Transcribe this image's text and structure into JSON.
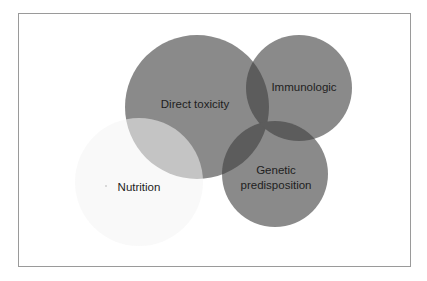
{
  "diagram": {
    "type": "venn",
    "sets": [
      {
        "id": "direct-toxicity",
        "label": "Direct toxicity",
        "label_lines": [
          "Direct toxicity"
        ],
        "cx": 197,
        "cy": 107,
        "r": 72,
        "fill": "#8a8a8a",
        "label_x": 195,
        "label_y": 108
      },
      {
        "id": "immunologic",
        "label": "Immunologic",
        "label_lines": [
          "Immunologic"
        ],
        "cx": 299,
        "cy": 88,
        "r": 53,
        "fill": "#8a8a8a",
        "label_x": 304,
        "label_y": 91
      },
      {
        "id": "genetic-predisposition",
        "label": "Genetic predisposition",
        "label_lines": [
          "Genetic",
          "predisposition"
        ],
        "cx": 275,
        "cy": 174,
        "r": 53,
        "fill": "#8a8a8a",
        "label_x": 276,
        "label_y": 174
      },
      {
        "id": "nutrition",
        "label": "Nutrition",
        "label_lines": [
          "Nutrition"
        ],
        "cx": 139,
        "cy": 182,
        "r": 64,
        "fill": "#ececec",
        "label_x": 139,
        "label_y": 191
      }
    ],
    "colors": {
      "frame_border": "#9a9a9a",
      "background": "#ffffff",
      "circle_dark": "#8a8a8a",
      "overlap_dark": "#5c5c5c",
      "circle_light": "#ececec",
      "overlap_light": "#a8a8a8",
      "text": "#1e1e1e"
    }
  }
}
